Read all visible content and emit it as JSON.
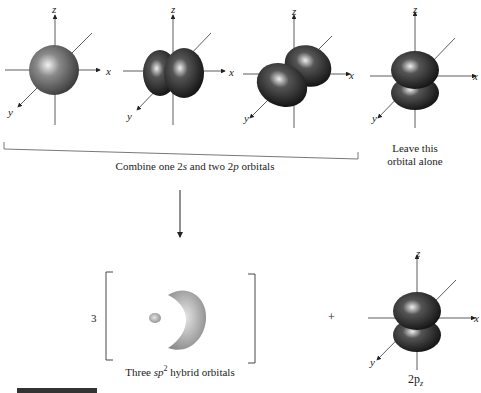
{
  "figure": {
    "top_row": {
      "orbitals": [
        {
          "name": "2s",
          "axes": {
            "z": "z",
            "x": "x",
            "y": "y"
          }
        },
        {
          "name": "2px",
          "axes": {
            "z": "z",
            "x": "x",
            "y": "y"
          }
        },
        {
          "name": "2py",
          "axes": {
            "z": "z",
            "x": "x",
            "y": "y"
          }
        },
        {
          "name": "2pz",
          "axes": {
            "z": "z",
            "x": "x",
            "y": "y"
          }
        }
      ],
      "combine_caption_pre": "Combine one 2",
      "combine_caption_s": "s",
      "combine_caption_mid": " and two 2",
      "combine_caption_p": "p",
      "combine_caption_post": " orbitals",
      "leave_caption_line1": "Leave this",
      "leave_caption_line2": "orbital alone"
    },
    "bottom_row": {
      "multiplier": "3",
      "hybrid_caption_pre": "Three ",
      "hybrid_caption_sp": "sp",
      "hybrid_caption_sup": "2",
      "hybrid_caption_post": " hybrid orbitals",
      "plus": "+",
      "pz_label_main": "2p",
      "pz_label_sub": "z",
      "pz_axes": {
        "z": "z",
        "x": "x",
        "y": "y"
      }
    },
    "figure_label": "FIGURE 1.16"
  },
  "colors": {
    "lobe_dark": "#1a1a1a",
    "lobe_mid": "#6d6d6d",
    "hybrid": "#9a9a9a",
    "axis": "#333333"
  }
}
